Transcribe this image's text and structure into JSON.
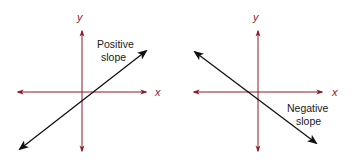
{
  "colors": {
    "axis": "#8b1a2b",
    "axis_label": "#8b1a2b",
    "line": "#111111",
    "text": "#1a1a1a",
    "background": "#ffffff"
  },
  "diagrams": [
    {
      "id": "positive",
      "x_axis_label": "x",
      "y_axis_label": "y",
      "line_label_line1": "Positive",
      "line_label_line2": "slope",
      "slope_sign": "positive"
    },
    {
      "id": "negative",
      "x_axis_label": "x",
      "y_axis_label": "y",
      "line_label_line1": "Negative",
      "line_label_line2": "slope",
      "slope_sign": "negative"
    }
  ]
}
